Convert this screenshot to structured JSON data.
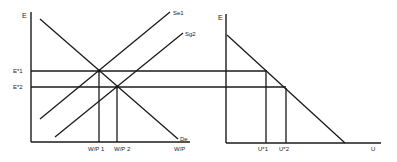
{
  "left_panel": {
    "y_axis_label": "E",
    "x_axis_label": "W/P",
    "curves": {
      "supply1": "Se1",
      "supply2": "Sg2",
      "demand": "De"
    },
    "y_ticks": [
      "E*1",
      "E*2"
    ],
    "x_ticks": [
      "W/P 1",
      "W/P 2"
    ]
  },
  "right_panel": {
    "y_axis_label": "E",
    "x_axis_label": "U",
    "x_ticks": [
      "U*1",
      "U*2"
    ]
  },
  "colors": {
    "ink": "#1a1a1a",
    "background": "#ffffff"
  }
}
